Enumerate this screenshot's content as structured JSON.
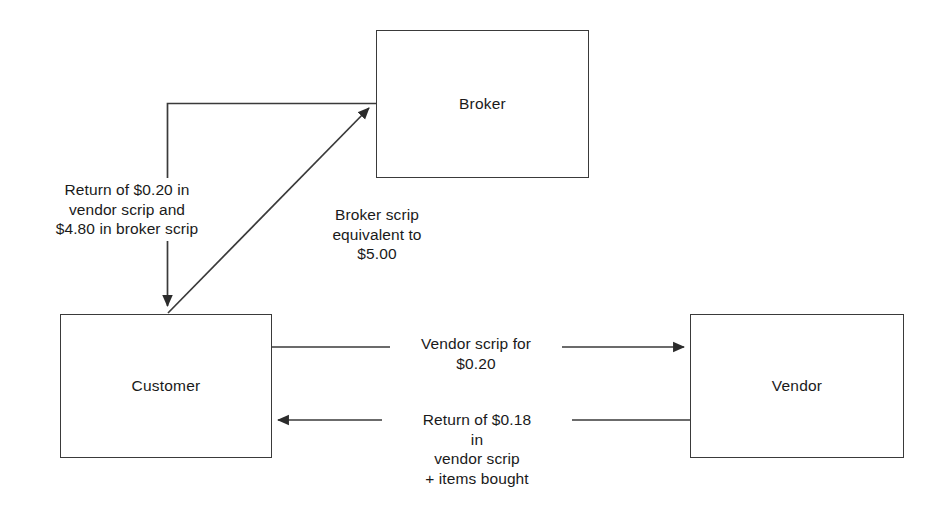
{
  "diagram": {
    "line_color": "#3a3a3a",
    "text_color": "#1a1a1a",
    "background": "#ffffff",
    "nodes": [
      {
        "id": "broker",
        "label": "Broker"
      },
      {
        "id": "customer",
        "label": "Customer"
      },
      {
        "id": "vendor",
        "label": "Vendor"
      }
    ],
    "edges": [
      {
        "id": "customer-to-broker",
        "from": "Customer",
        "to": "Broker",
        "label": "Broker scrip\nequivalent to\n$5.00",
        "arrow": "to-broker"
      },
      {
        "id": "broker-to-customer",
        "from": "Broker",
        "to": "Customer",
        "label": "Return of  $0.20 in\nvendor scrip and\n$4.80 in broker scrip",
        "arrow": "to-customer"
      },
      {
        "id": "customer-to-vendor",
        "from": "Customer",
        "to": "Vendor",
        "label": "Vendor scrip for\n$0.20",
        "arrow": "to-vendor"
      },
      {
        "id": "vendor-to-customer",
        "from": "Vendor",
        "to": "Customer",
        "label": "Return of $0.18\nin\nvendor scrip\n+ items bought",
        "arrow": "to-customer"
      }
    ]
  }
}
